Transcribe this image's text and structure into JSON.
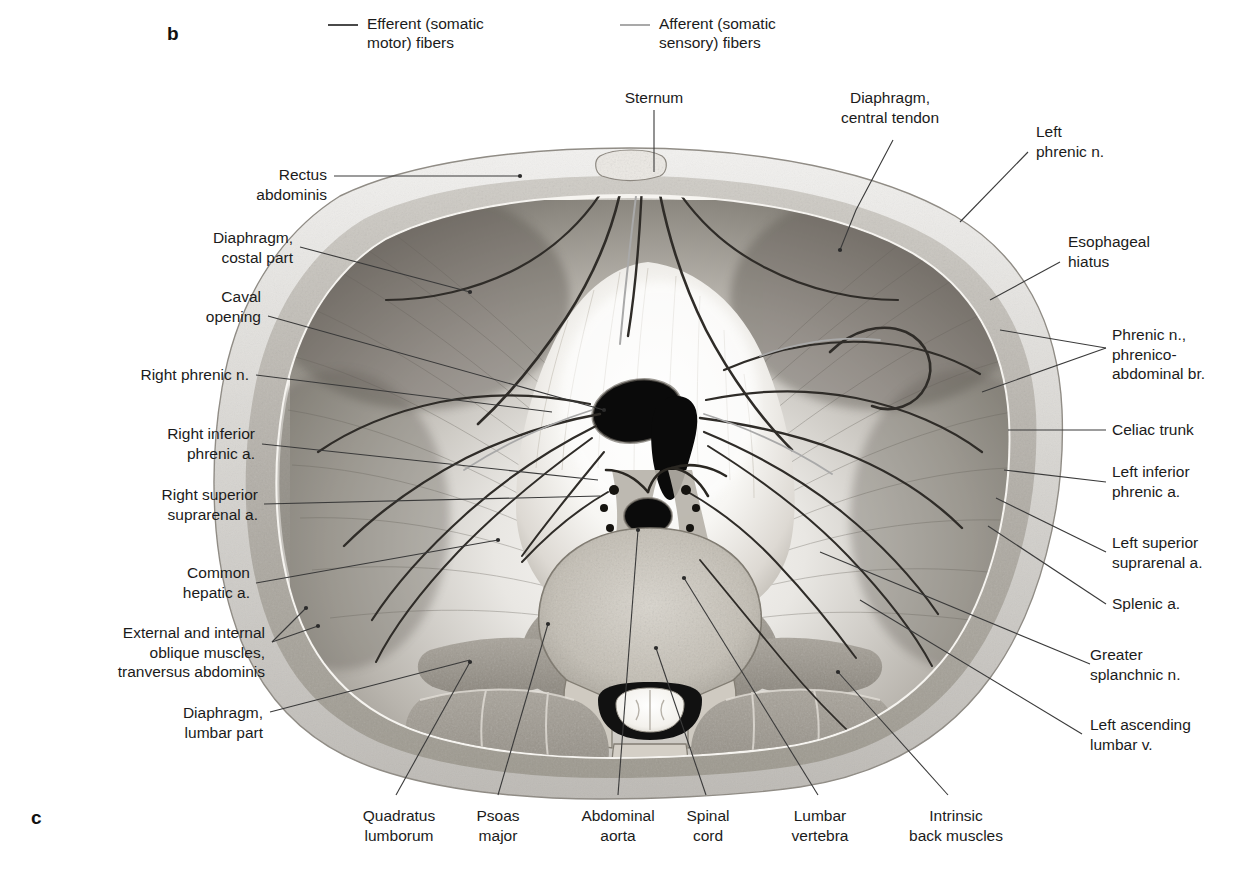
{
  "figure": {
    "panel_letter_b": "b",
    "panel_letter_c": "c",
    "colors": {
      "efferent_line": "#4a4a4a",
      "afferent_line": "#a9a9a9",
      "leader_line": "#3a3a3a",
      "text": "#1b1b1b",
      "background": "#ffffff"
    }
  },
  "legend": {
    "items": [
      {
        "label": "Efferent (somatic\nmotor) fibers",
        "color": "#4a4a4a",
        "name": "efferent-somatic-motor-fibers"
      },
      {
        "label": "Afferent (somatic\nsensory) fibers",
        "color": "#a9a9a9",
        "name": "afferent-somatic-sensory-fibers"
      }
    ]
  },
  "labels": {
    "top": [
      {
        "id": "sternum",
        "text": "Sternum"
      },
      {
        "id": "diaphragm_central_tendon",
        "text": "Diaphragm,\ncentral tendon"
      }
    ],
    "left": [
      {
        "id": "rectus_abdominis",
        "text": "Rectus\nabdominis"
      },
      {
        "id": "diaphragm_costal_part",
        "text": "Diaphragm,\ncostal part"
      },
      {
        "id": "caval_opening",
        "text": "Caval\nopening"
      },
      {
        "id": "right_phrenic_n",
        "text": "Right phrenic n."
      },
      {
        "id": "right_inferior_phrenic_a",
        "text": "Right inferior\nphrenic a."
      },
      {
        "id": "right_superior_suprarenal_a",
        "text": "Right superior\nsuprarenal a."
      },
      {
        "id": "common_hepatic_a",
        "text": "Common\nhepatic a."
      },
      {
        "id": "external_internal_oblique",
        "text": "External and internal\noblique muscles,\ntranversus abdominis"
      },
      {
        "id": "diaphragm_lumbar_part",
        "text": "Diaphragm,\nlumbar part"
      }
    ],
    "right": [
      {
        "id": "left_phrenic_n",
        "text": "Left\nphrenic n."
      },
      {
        "id": "esophageal_hiatus",
        "text": "Esophageal\nhiatus"
      },
      {
        "id": "phrenic_n_phrenicoabdominal_br",
        "text": "Phrenic n.,\nphrenico-\nabdominal br."
      },
      {
        "id": "celiac_trunk",
        "text": "Celiac trunk"
      },
      {
        "id": "left_inferior_phrenic_a",
        "text": "Left inferior\nphrenic a."
      },
      {
        "id": "left_superior_suprarenal_a",
        "text": "Left superior\nsuprarenal a."
      },
      {
        "id": "splenic_a",
        "text": "Splenic a."
      },
      {
        "id": "greater_splanchnic_n",
        "text": "Greater\nsplanchnic n."
      },
      {
        "id": "left_ascending_lumbar_v",
        "text": "Left ascending\nlumbar v."
      }
    ],
    "bottom": [
      {
        "id": "quadratus_lumborum",
        "text": "Quadratus\nlumborum"
      },
      {
        "id": "psoas_major",
        "text": "Psoas\nmajor"
      },
      {
        "id": "abdominal_aorta",
        "text": "Abdominal\naorta"
      },
      {
        "id": "spinal_cord",
        "text": "Spinal\ncord"
      },
      {
        "id": "lumbar_vertebra",
        "text": "Lumbar\nvertebra"
      },
      {
        "id": "intrinsic_back_muscles",
        "text": "Intrinsic\nback muscles"
      }
    ]
  }
}
